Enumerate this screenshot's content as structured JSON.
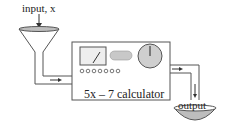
{
  "diagram": {
    "input_label": "input, x",
    "machine_label": "5x – 7 calculator",
    "output_label": "output",
    "colors": {
      "stroke": "#444444",
      "fill_gray": "#cfcfcf",
      "background": "#ffffff"
    }
  }
}
